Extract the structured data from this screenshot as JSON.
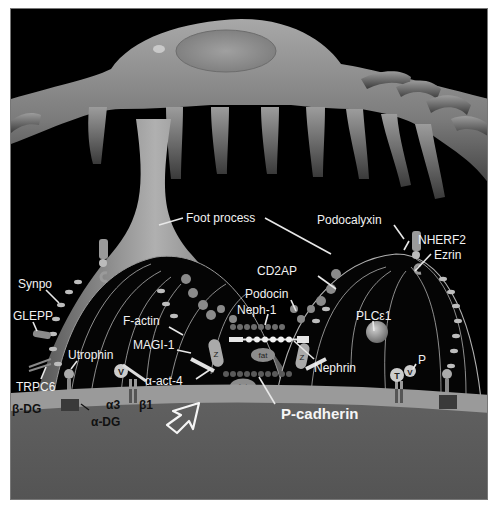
{
  "figure": {
    "labels": {
      "foot_process": "Foot process",
      "podocalyxin": "Podocalyxin",
      "nherf2": "NHERF2",
      "ezrin": "Ezrin",
      "synpo": "Synpo",
      "cd2ap": "CD2AP",
      "podocin": "Podocin",
      "neph1": "Neph-1",
      "f_actin": "F-actin",
      "magi1": "MAGI-1",
      "plce1": "PLCε1",
      "glepp": "GLEPP",
      "utrophin": "Utrophin",
      "nephrin": "Nephrin",
      "alpha_act4": "α-act-4",
      "trpc6": "TRPC6",
      "alpha3": "α3",
      "beta1": "β1",
      "beta_dg": "β-DG",
      "alpha_dg": "α-DG",
      "p_cadherin": "P-cadherin",
      "phospho": "P"
    },
    "glyphs": {
      "fat_1": "fat",
      "fat_2": "fat",
      "z_left": "Z",
      "z_right": "Z",
      "v_left": "V",
      "v_right": "V",
      "t_right": "T"
    },
    "colors": {
      "background": "#000000",
      "cell_body": "#8a8a8a",
      "gbm_top": "#9a9a9a",
      "gbm_bottom": "#5c5c5c",
      "label": "#f2f2f2"
    }
  }
}
